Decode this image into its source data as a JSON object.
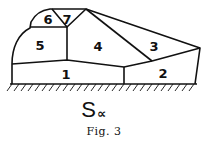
{
  "figure": {
    "title_main": "S",
    "title_subscript": "∝",
    "caption": "Fig. 3"
  },
  "regions": [
    {
      "id": "1",
      "label": "1"
    },
    {
      "id": "2",
      "label": "2"
    },
    {
      "id": "3",
      "label": "3"
    },
    {
      "id": "4",
      "label": "4"
    },
    {
      "id": "5",
      "label": "5"
    },
    {
      "id": "6",
      "label": "6"
    },
    {
      "id": "7",
      "label": "7"
    }
  ],
  "colors": {
    "ink": "#111111",
    "background": "#ffffff"
  }
}
